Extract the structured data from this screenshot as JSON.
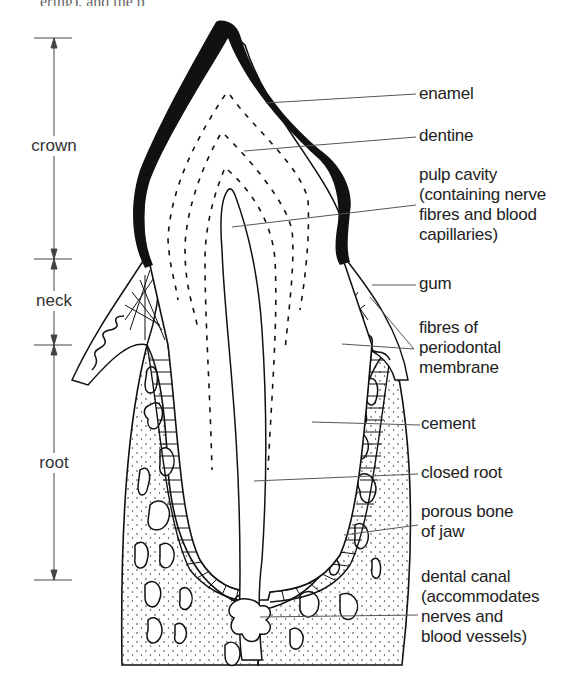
{
  "figure": {
    "top_cut_text": "ering), and the p",
    "dimension_labels": [
      {
        "label": "crown",
        "top": 38,
        "bottom": 259
      },
      {
        "label": "neck",
        "top": 259,
        "bottom": 345
      },
      {
        "label": "root",
        "top": 345,
        "bottom": 580
      }
    ],
    "labels": [
      {
        "id": "enamel",
        "text": "enamel"
      },
      {
        "id": "dentine",
        "text": "dentine"
      },
      {
        "id": "pulp-cavity",
        "text": "pulp cavity\n(containing nerve\nfibres and blood\ncapillaries)"
      },
      {
        "id": "gum",
        "text": "gum"
      },
      {
        "id": "fibres",
        "text": "fibres of\nperiodontal\nmembrane"
      },
      {
        "id": "cement",
        "text": "cement"
      },
      {
        "id": "closed-root",
        "text": "closed root"
      },
      {
        "id": "porous-bone",
        "text": "porous bone\nof jaw"
      },
      {
        "id": "dental-canal",
        "text": "dental canal\n(accommodates\nnerves and\nblood vessels)"
      }
    ],
    "colors": {
      "ink": "#111111",
      "leader": "#555555",
      "text": "#222222",
      "background": "#ffffff"
    }
  }
}
